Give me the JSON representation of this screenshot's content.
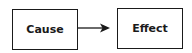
{
  "diagram": {
    "nodes": [
      {
        "id": "cause",
        "label": "Cause"
      },
      {
        "id": "effect",
        "label": "Effect"
      }
    ],
    "edges": [
      {
        "from": "cause",
        "to": "effect",
        "type": "arrow"
      }
    ],
    "colors": {
      "stroke": "#1a1a1a",
      "fill": "#ffffff",
      "text": "#1a1a1a"
    }
  }
}
